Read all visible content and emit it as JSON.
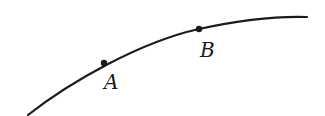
{
  "diagram": {
    "type": "curve-with-points",
    "curve": {
      "color": "#1a1a1a",
      "path": "M28,115 C70,82 140,42 199,29 C240,20 275,16 307,17"
    },
    "points": [
      {
        "label": "A",
        "x": 104,
        "y": 63,
        "label_x": 104,
        "label_y": 89
      },
      {
        "label": "B",
        "x": 199,
        "y": 29,
        "label_x": 200,
        "label_y": 57
      }
    ]
  }
}
